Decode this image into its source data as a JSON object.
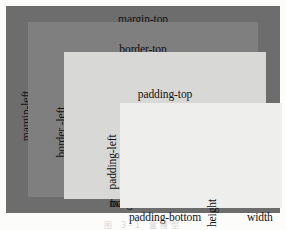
{
  "diagram": {
    "caption": "图 3-1  盒模型",
    "boxes": {
      "margin": {
        "name": "margin-box",
        "color": "#6d6d6d"
      },
      "border": {
        "name": "border-box",
        "color": "#7f7f7f"
      },
      "padding": {
        "name": "padding-box",
        "color": "#d8d8d6"
      },
      "content": {
        "name": "content-box",
        "color": "#eeeeec"
      }
    },
    "labels": {
      "margin_top": "margin-top",
      "border_top": "border-top",
      "padding_top": "padding-top",
      "padding_bottom": "padding-bottom",
      "border_bottom": "border-bottom",
      "margin_bottom": "margin-bottom",
      "margin_left": "margin-left",
      "border_left": "border -left",
      "padding_left": "padding-left",
      "padding_right": "padding-right",
      "border_right": "border-right",
      "margin_right": "margin-right",
      "height": "height",
      "width": "width"
    }
  }
}
